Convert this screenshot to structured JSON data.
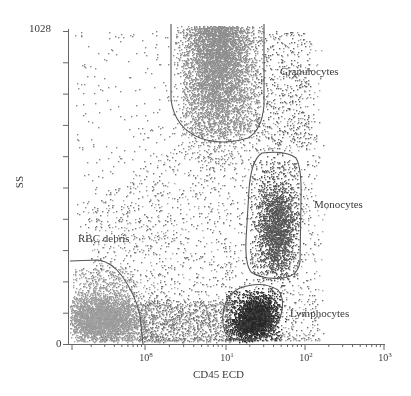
{
  "chart_data": {
    "type": "scatter",
    "title": "",
    "xlabel": "CD45 ECD",
    "ylabel": "SS",
    "x_scale": "log",
    "x_ticks": [
      {
        "base": "10",
        "exp": "8",
        "pos": 145
      },
      {
        "base": "10",
        "exp": "1",
        "pos": 226
      },
      {
        "base": "10",
        "exp": "2",
        "pos": 305
      },
      {
        "base": "10",
        "exp": "3",
        "pos": 384
      }
    ],
    "y_ticks": [
      {
        "label": "1028",
        "value": 1028
      },
      {
        "label": "0",
        "value": 0
      }
    ],
    "ylim": [
      0,
      1028
    ],
    "xlim_decades": [
      -1,
      3
    ],
    "grid": false,
    "legend": null,
    "populations": [
      {
        "name": "Granulocytes",
        "label": "Granulocytes",
        "color": "#8f8f8f",
        "center_x_decade": 0.9,
        "center_ss": 900,
        "count": 3200,
        "description": "high side scatter, moderate CD45"
      },
      {
        "name": "Monocytes",
        "label": "Monocytes",
        "color": "#555555",
        "center_x_decade": 1.7,
        "center_ss": 360,
        "count": 1400,
        "description": "intermediate side scatter, higher CD45"
      },
      {
        "name": "Lymphocytes",
        "label": "Lymphocytes",
        "color": "#2a2a2a",
        "center_x_decade": 1.4,
        "center_ss": 90,
        "count": 1900,
        "description": "low side scatter, bright CD45"
      },
      {
        "name": "RBC debris",
        "label": "RBC debris",
        "color": "#9a9a9a",
        "center_x_decade": -0.4,
        "center_ss": 80,
        "count": 2400,
        "description": "low side scatter, CD45 negative"
      }
    ],
    "annotations": [
      "Granulocytes",
      "Monocytes",
      "Lymphocytes",
      "RBC debris"
    ]
  },
  "axes": {
    "x_label": "CD45 ECD",
    "y_label": "SS",
    "y_max_label": "1028",
    "y_min_label": "0"
  },
  "gates": {
    "granulocytes": "Granulocytes",
    "monocytes": "Monocytes",
    "lymphocytes": "Lymphocytes",
    "rbc_debris": "RBC debris"
  }
}
